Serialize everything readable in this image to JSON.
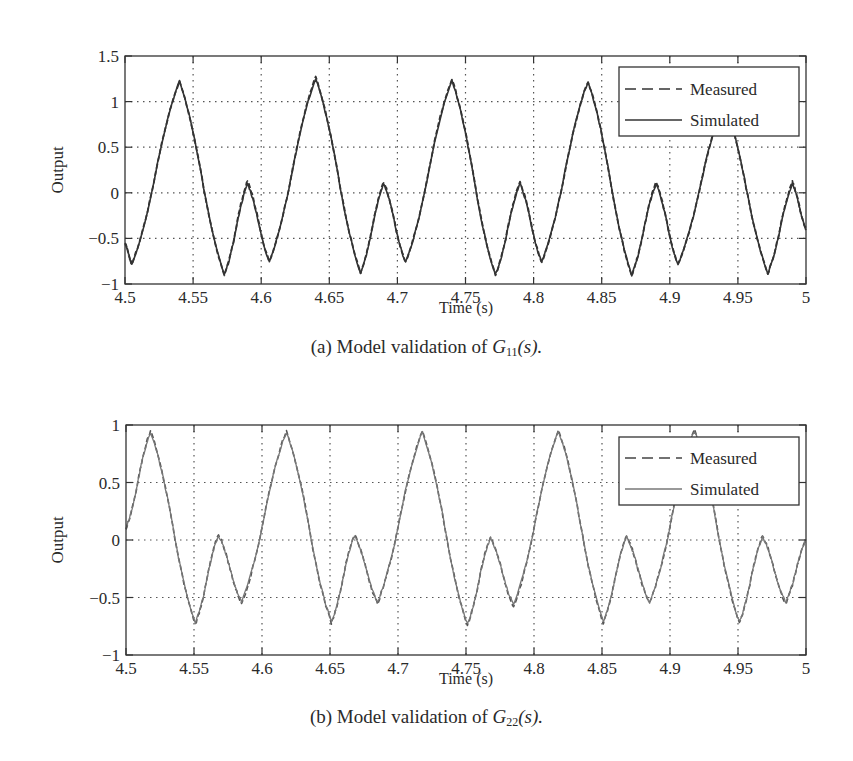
{
  "figure": {
    "panels": [
      {
        "id": "a",
        "caption_prefix": "(a) Model validation of ",
        "caption_symbol": "G",
        "caption_sub": "11",
        "caption_suffix": "(s).",
        "xlabel": "Time (s)",
        "ylabel": "Output",
        "legend": {
          "measured": "Measured",
          "simulated": "Simulated"
        }
      },
      {
        "id": "b",
        "caption_prefix": "(b) Model validation of ",
        "caption_symbol": "G",
        "caption_sub": "22",
        "caption_suffix": "(s).",
        "xlabel": "Time (s)",
        "ylabel": "Output",
        "legend": {
          "measured": "Measured",
          "simulated": "Simulated"
        }
      }
    ]
  },
  "chart_data": [
    {
      "type": "line",
      "title": "(a) Model validation of G11(s).",
      "xlabel": "Time (s)",
      "ylabel": "Output",
      "xlim": [
        4.5,
        5
      ],
      "ylim": [
        -1,
        1.5
      ],
      "xticks": [
        "4.5",
        "4.55",
        "4.6",
        "4.65",
        "4.7",
        "4.75",
        "4.8",
        "4.85",
        "4.9",
        "4.95",
        "5"
      ],
      "yticks": [
        "-1",
        "-0.5",
        "0",
        "0.5",
        "1",
        "1.5"
      ],
      "grid": true,
      "legend_position": "upper right",
      "series": [
        {
          "name": "Measured",
          "style": "dashed",
          "color": "#333333",
          "x": [
            4.5,
            4.505,
            4.54,
            4.573,
            4.59,
            4.606,
            4.64,
            4.673,
            4.69,
            4.706,
            4.74,
            4.772,
            4.79,
            4.806,
            4.84,
            4.872,
            4.89,
            4.906,
            4.94,
            4.972,
            4.99,
            5.0
          ],
          "y": [
            -0.55,
            -0.78,
            1.22,
            -0.9,
            0.13,
            -0.75,
            1.27,
            -0.88,
            0.12,
            -0.76,
            1.25,
            -0.9,
            0.12,
            -0.76,
            1.22,
            -0.9,
            0.12,
            -0.78,
            1.0,
            -0.88,
            0.12,
            -0.4
          ]
        },
        {
          "name": "Simulated",
          "style": "solid",
          "color": "#333333",
          "x": [
            4.5,
            4.505,
            4.54,
            4.573,
            4.59,
            4.606,
            4.64,
            4.673,
            4.69,
            4.706,
            4.74,
            4.772,
            4.79,
            4.806,
            4.84,
            4.872,
            4.89,
            4.906,
            4.94,
            4.972,
            4.99,
            5.0
          ],
          "y": [
            -0.55,
            -0.78,
            1.22,
            -0.9,
            0.1,
            -0.75,
            1.25,
            -0.88,
            0.1,
            -0.76,
            1.23,
            -0.9,
            0.1,
            -0.76,
            1.22,
            -0.9,
            0.1,
            -0.78,
            1.0,
            -0.88,
            0.1,
            -0.4
          ]
        }
      ]
    },
    {
      "type": "line",
      "title": "(b) Model validation of G22(s).",
      "xlabel": "Time (s)",
      "ylabel": "Output",
      "xlim": [
        4.5,
        5
      ],
      "ylim": [
        -1,
        1
      ],
      "xticks": [
        "4.5",
        "4.55",
        "4.6",
        "4.65",
        "4.7",
        "4.75",
        "4.8",
        "4.85",
        "4.9",
        "4.95",
        "5"
      ],
      "yticks": [
        "-1",
        "-0.5",
        "0",
        "0.5",
        "1"
      ],
      "grid": true,
      "legend_position": "upper right",
      "series": [
        {
          "name": "Measured",
          "style": "dashed",
          "color": "#555555",
          "x": [
            4.5,
            4.518,
            4.551,
            4.568,
            4.585,
            4.618,
            4.651,
            4.668,
            4.685,
            4.718,
            4.751,
            4.768,
            4.785,
            4.818,
            4.851,
            4.868,
            4.885,
            4.918,
            4.951,
            4.968,
            4.985,
            5.0
          ],
          "y": [
            0.1,
            0.95,
            -0.73,
            0.05,
            -0.55,
            0.95,
            -0.72,
            0.05,
            -0.55,
            0.95,
            -0.74,
            0.03,
            -0.58,
            0.96,
            -0.72,
            0.04,
            -0.55,
            0.96,
            -0.72,
            0.04,
            -0.55,
            0.0
          ]
        },
        {
          "name": "Simulated",
          "style": "solid",
          "color": "#777777",
          "x": [
            4.5,
            4.518,
            4.551,
            4.568,
            4.585,
            4.618,
            4.651,
            4.668,
            4.685,
            4.718,
            4.751,
            4.768,
            4.785,
            4.818,
            4.851,
            4.868,
            4.885,
            4.918,
            4.951,
            4.968,
            4.985,
            5.0
          ],
          "y": [
            0.1,
            0.94,
            -0.72,
            0.04,
            -0.54,
            0.94,
            -0.71,
            0.04,
            -0.54,
            0.94,
            -0.73,
            0.02,
            -0.56,
            0.95,
            -0.71,
            0.03,
            -0.54,
            0.95,
            -0.71,
            0.03,
            -0.54,
            0.0
          ]
        }
      ]
    }
  ]
}
